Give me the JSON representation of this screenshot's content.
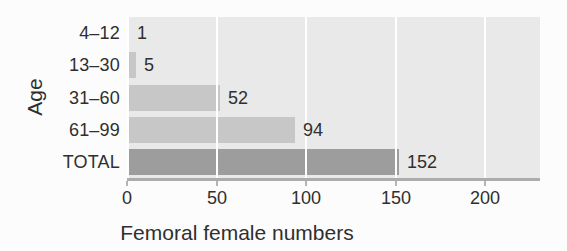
{
  "figure": {
    "background": "#fcfcfc",
    "panel_background": "#e9e9e9",
    "gridline_color": "#ffffff",
    "axis_line_color": "#acacac",
    "tick_mark_color": "#b4b4b4",
    "text_color": "#2f2f2f",
    "age_bar_color": "#c7c7c7",
    "total_bar_color": "#9d9d9d"
  },
  "chart_data": {
    "type": "bar",
    "orientation": "horizontal",
    "title": "",
    "xlabel": "Femoral female numbers",
    "ylabel": "Age",
    "categories": [
      "4–12",
      "13–30",
      "31–60",
      "61–99",
      "TOTAL"
    ],
    "values": [
      1,
      5,
      52,
      94,
      152
    ],
    "value_labels": [
      "1",
      "5",
      "52",
      "94",
      "152"
    ],
    "x_ticks": [
      0,
      50,
      100,
      150,
      200
    ],
    "x_tick_labels": [
      "0",
      "50",
      "100",
      "150",
      "200"
    ],
    "xlim": [
      0,
      231
    ],
    "grid": "vertical white gridlines over gray panel, drawn above bars",
    "legend": "none"
  }
}
